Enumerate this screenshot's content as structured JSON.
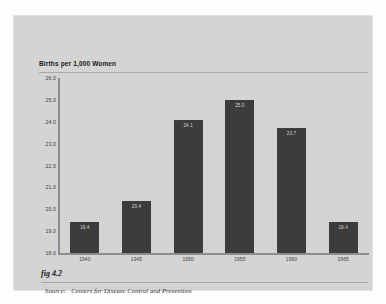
{
  "figure": {
    "label": "fig 4.2",
    "source_prefix": "Source:",
    "source_text": "Centers for Disease Control and Prevention"
  },
  "colors": {
    "card_background": "#d4d4d4",
    "bar": "#3c3c3c",
    "axis": "#8c8c8c",
    "rule": "#a8a8a8",
    "bar_label": "#d8d8d8",
    "text": "#1a1a1a"
  },
  "chart_data": {
    "type": "bar",
    "title": "Births per 1,000 Women",
    "xlabel": "",
    "ylabel": "Births per 1,000 Women",
    "categories": [
      "1940",
      "1945",
      "1950",
      "1955",
      "1960",
      "1965"
    ],
    "values": [
      19.4,
      20.4,
      24.1,
      25.0,
      23.7,
      19.4
    ],
    "value_labels": [
      "19.4",
      "20.4",
      "24.1",
      "25.0",
      "23.7",
      "19.4"
    ],
    "ylim": [
      18.0,
      26.0
    ],
    "yticks": [
      26.0,
      25.0,
      24.0,
      23.0,
      22.0,
      21.0,
      20.0,
      19.0,
      18.0
    ],
    "ytick_labels": [
      "26.0",
      "25.0",
      "24.0",
      "23.0",
      "22.0",
      "21.0",
      "20.0",
      "19.0",
      "18.0"
    ],
    "grid": false,
    "legend": null,
    "legend_position": "none"
  }
}
